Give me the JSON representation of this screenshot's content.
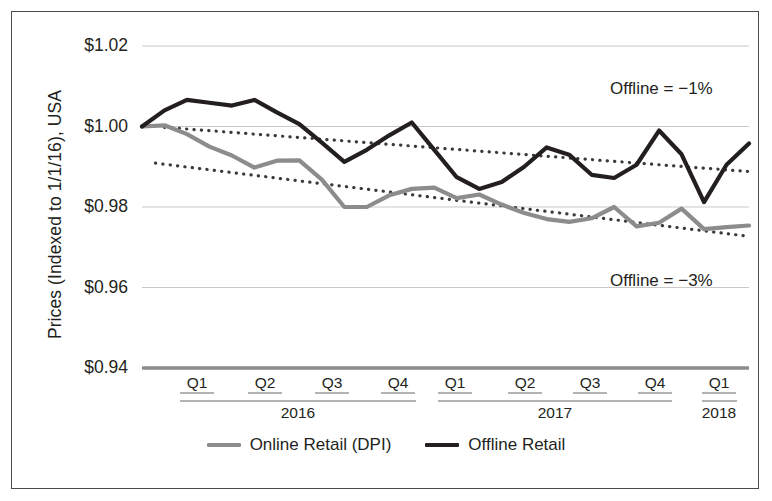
{
  "chart_data": {
    "type": "line",
    "title": "",
    "xlabel": "",
    "ylabel": "Prices (Indexed to 1/1/16), USA",
    "ylim": [
      0.94,
      1.02
    ],
    "yticks": [
      1.02,
      1.0,
      0.98,
      0.96,
      0.94
    ],
    "ytick_labels": [
      "$1.02",
      "$1.00",
      "$0.98",
      "$0.96",
      "$0.94"
    ],
    "grid": true,
    "legend_position": "bottom-center",
    "x_axis": {
      "quarter_labels": [
        "Q1",
        "Q2",
        "Q3",
        "Q4",
        "Q1",
        "Q2",
        "Q3",
        "Q4",
        "Q1"
      ],
      "year_groups": [
        {
          "year": "2016",
          "quarters": [
            "Q1",
            "Q2",
            "Q3",
            "Q4"
          ]
        },
        {
          "year": "2017",
          "quarters": [
            "Q1",
            "Q2",
            "Q3",
            "Q4"
          ]
        },
        {
          "year": "2018",
          "quarters": [
            "Q1"
          ]
        }
      ]
    },
    "series": [
      {
        "name": "Online Retail (DPI)",
        "color": "#8c8c8c",
        "style": "solid",
        "values": [
          1.0,
          1.0003,
          0.9981,
          0.995,
          0.9928,
          0.9898,
          0.9915,
          0.9916,
          0.9868,
          0.98,
          0.98,
          0.9829,
          0.9845,
          0.9848,
          0.9822,
          0.9831,
          0.9806,
          0.9785,
          0.977,
          0.9763,
          0.9772,
          0.98,
          0.9752,
          0.9761,
          0.9796,
          0.9745,
          0.975,
          0.9754
        ]
      },
      {
        "name": "Offline Retail",
        "color": "#231f20",
        "style": "solid",
        "values": [
          1.0,
          1.004,
          1.0066,
          1.0059,
          1.0052,
          1.0066,
          1.0035,
          1.0006,
          0.996,
          0.9912,
          0.9942,
          0.9978,
          1.001,
          0.9942,
          0.9874,
          0.9845,
          0.9862,
          0.99,
          0.9948,
          0.993,
          0.988,
          0.9872,
          0.9905,
          0.999,
          0.9931,
          0.9812,
          0.9905,
          0.9958
        ]
      }
    ],
    "trendlines": [
      {
        "name": "Offline trend",
        "for_series": "Offline Retail",
        "color": "#3a3a3a",
        "style": "dotted",
        "annotation": "Offline = −1%",
        "start": [
          1,
          0.9998
        ],
        "end": [
          27,
          0.9888
        ]
      },
      {
        "name": "Online trend",
        "for_series": "Online Retail (DPI)",
        "color": "#3a3a3a",
        "style": "dotted",
        "annotation": "Offline = −3%",
        "start": [
          0.6,
          0.9909
        ],
        "end": [
          27,
          0.9727
        ]
      }
    ],
    "annotations": [
      {
        "text": "Offline = −1%",
        "x_px": 609,
        "y_px": 78
      },
      {
        "text": "Offline = −3%",
        "x_px": 609,
        "y_px": 270
      }
    ]
  },
  "legend": {
    "items": [
      {
        "label": "Online Retail (DPI)",
        "color": "#8c8c8c"
      },
      {
        "label": "Offline Retail",
        "color": "#231f20"
      }
    ]
  }
}
